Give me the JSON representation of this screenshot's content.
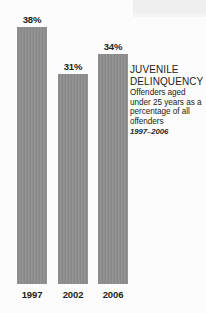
{
  "chart_data": {
    "type": "bar",
    "title": "JUVENILE DELINQUENCY",
    "subtitle": "Offenders aged under 25 years as a percentage of all offenders",
    "period": "1997–2006",
    "xlabel": "",
    "ylabel": "",
    "ylim": [
      0,
      42
    ],
    "grid": false,
    "legend": false,
    "unit": "%",
    "categories": [
      "1997",
      "2002",
      "2006"
    ],
    "values": [
      38,
      31,
      34
    ],
    "value_labels": [
      "38%",
      "31%",
      "34%"
    ],
    "series": [
      {
        "name": "Offenders aged under 25 years as a percentage of all offenders",
        "values": [
          38,
          31,
          34
        ]
      }
    ],
    "bar_color": "#8c8c8c",
    "text_color": "#232323",
    "background_color": "#fdfdfd"
  },
  "caption": {
    "title_line_1": "JUVENILE",
    "title_line_2": "DELINQUENCY",
    "title": "JUVENILE\nDELINQUENCY",
    "body": "Offenders aged under 25 years as a percentage of all offenders",
    "period": "1997–2006"
  },
  "bars": [
    {
      "value_label": "38%",
      "year": "1997",
      "value": 38
    },
    {
      "value_label": "31%",
      "year": "2002",
      "value": 31
    },
    {
      "value_label": "34%",
      "year": "2006",
      "value": 34
    }
  ]
}
